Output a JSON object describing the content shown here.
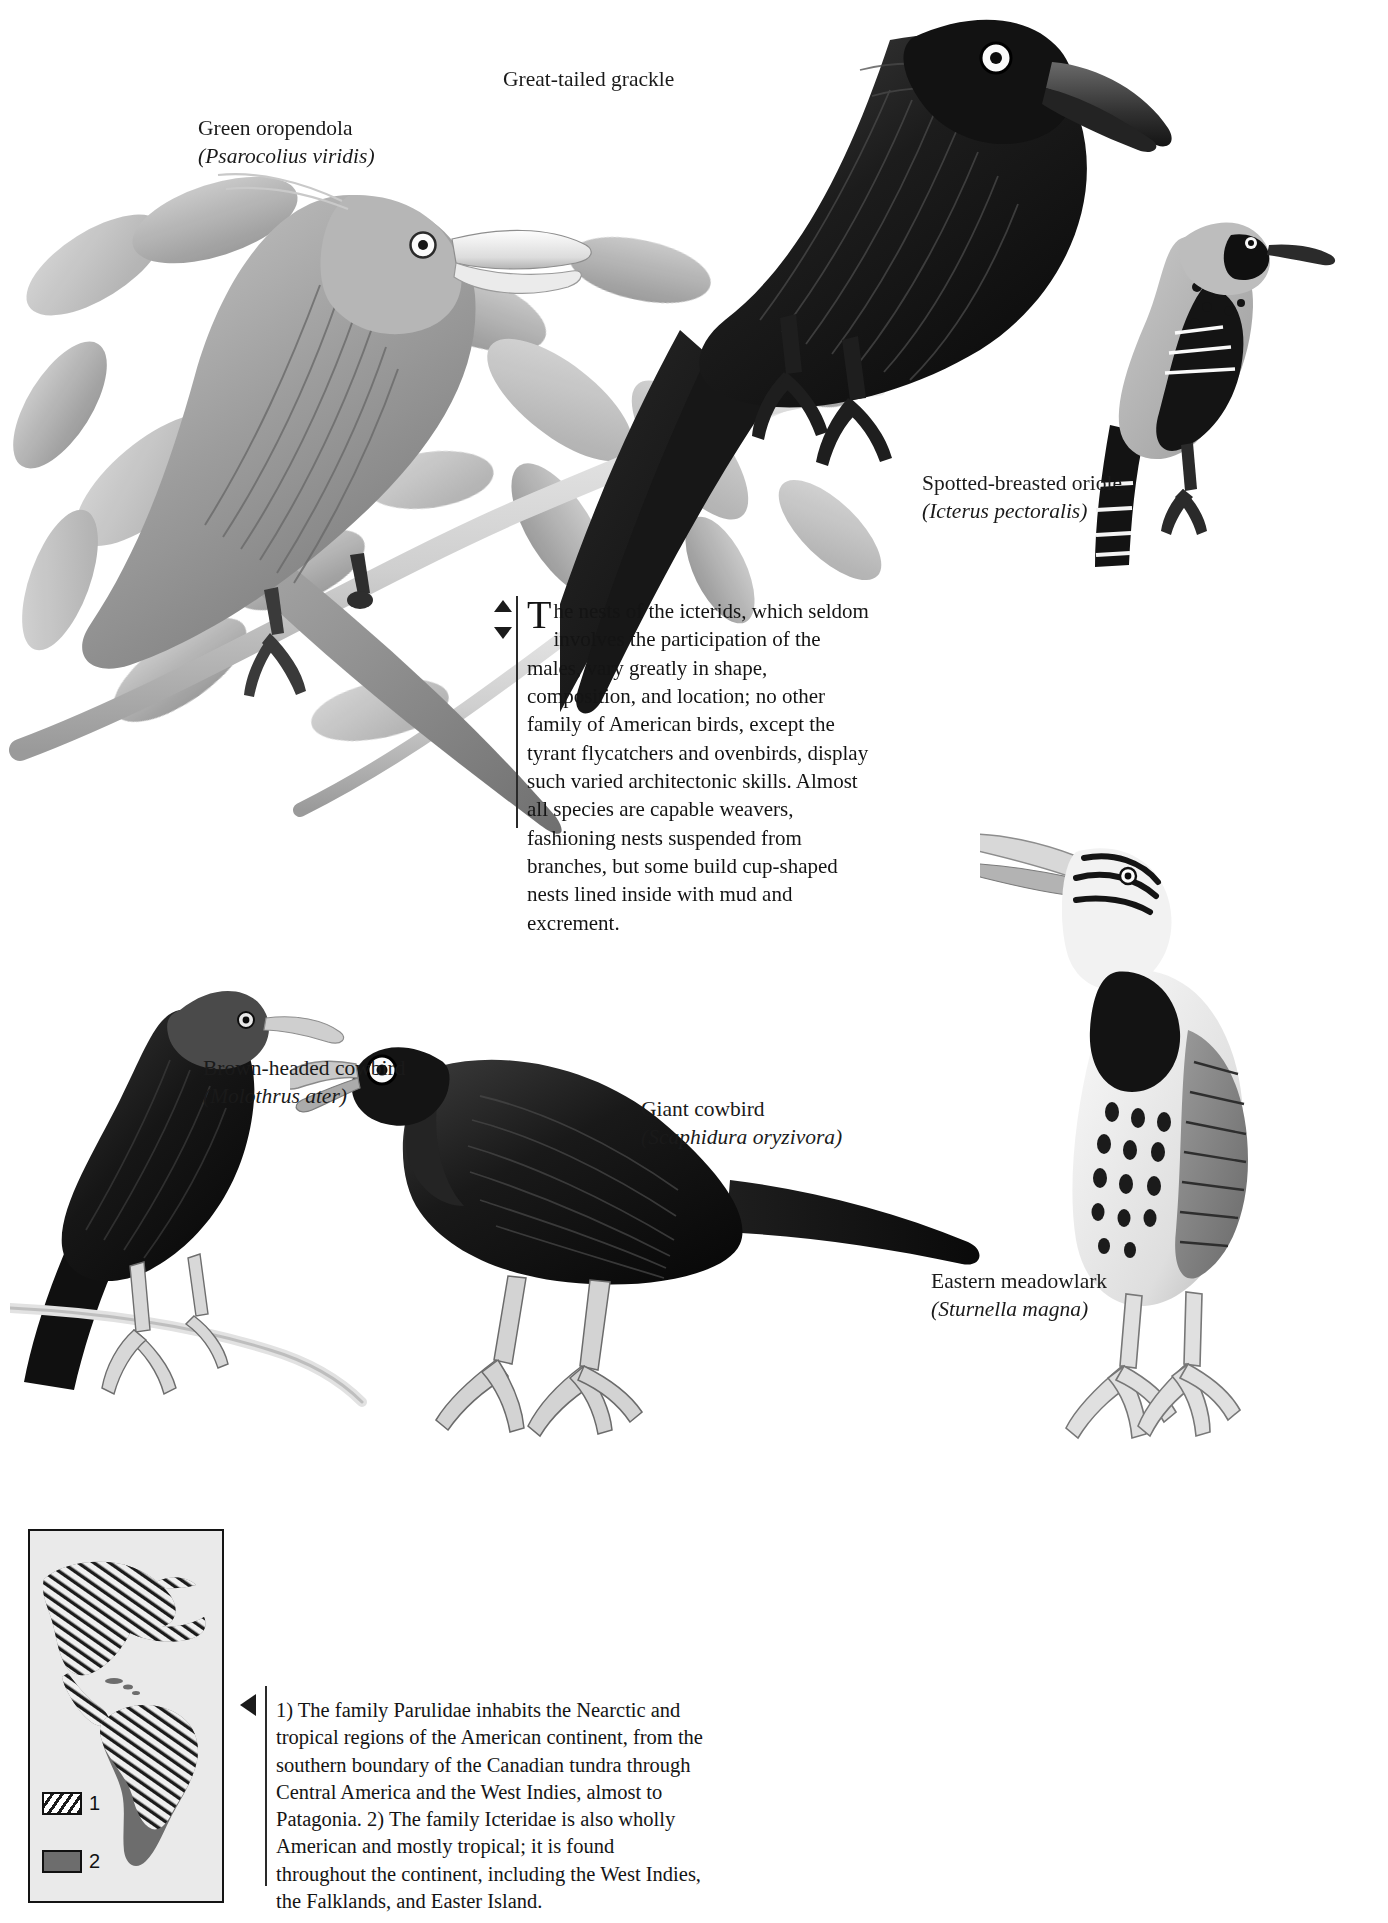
{
  "page": {
    "background_color": "#ffffff",
    "ink_color": "#141414"
  },
  "species_labels": [
    {
      "id": "green-oropendola",
      "common": "Green oropendola",
      "scientific": "(Psarocolius viridis)"
    },
    {
      "id": "great-tailed-grackle",
      "common": "Great-tailed grackle",
      "scientific": "(Cassidix mexicanus)"
    },
    {
      "id": "spotted-breasted-oriole",
      "common": "Spotted-breasted oriole",
      "scientific": "(Icterus pectoralis)"
    },
    {
      "id": "brown-headed-cowbird",
      "common": "Brown-headed cowbird",
      "scientific": "(Molothrus ater)"
    },
    {
      "id": "giant-cowbird",
      "common": "Giant cowbird",
      "scientific": "(Scaphidura oryzivora)"
    },
    {
      "id": "eastern-meadowlark",
      "common": "Eastern meadowlark",
      "scientific": "(Sturnella magna)"
    }
  ],
  "main_text": {
    "dropcap": "T",
    "body": "he nests of the icterids, which seldom involves the participation of the males, vary greatly in shape, composition, and location; no other family of American birds, except the tyrant flycatchers and ovenbirds, display such varied architectonic skills. Almost all species are capable weavers, fashioning nests suspended from branches, but some build cup-shaped nests lined inside with mud and excrement."
  },
  "map_caption": {
    "text": "1) The family Parulidae inhabits the Nearctic and tropical regions of the American continent, from the southern boundary of the Canadian tundra through Central America and the West Indies, almost to Patagonia. 2) The family Icteridae is also wholly American and mostly tropical; it is found throughout the continent, including the West Indies, the Falklands, and Easter Island."
  },
  "map_legend": [
    {
      "key": "1",
      "pattern": "hatched",
      "color": "#1b1b1b"
    },
    {
      "key": "2",
      "pattern": "solid",
      "color": "#6d6d6d"
    }
  ],
  "icons": {
    "scroll_up": "triangle-up-icon",
    "scroll_down": "triangle-down-icon",
    "caption_pointer": "triangle-left-icon"
  }
}
